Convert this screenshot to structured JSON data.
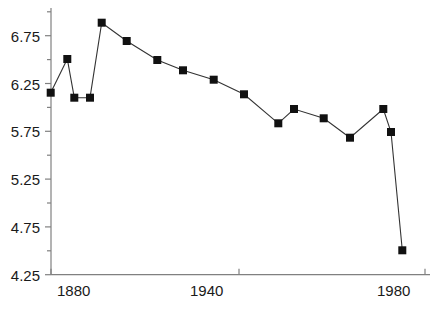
{
  "chart_data": {
    "type": "line",
    "title": "",
    "subtitle": "",
    "xlabel": "",
    "ylabel": "",
    "grid": false,
    "legend": null,
    "marker": "filled-square",
    "line_color": "#333333",
    "marker_color": "#111111",
    "axis_color": "#808080",
    "xlim": [
      1873,
      1986
    ],
    "ylim": [
      4.25,
      7.05
    ],
    "y_ticks_major": [
      4.25,
      4.75,
      5.25,
      5.75,
      6.25,
      6.75
    ],
    "y_ticks_major_labels": [
      "4.25",
      "4.75",
      "5.25",
      "5.75",
      "6.25",
      "6.75"
    ],
    "y_ticks_minor": [
      4.5,
      5.0,
      5.5,
      6.0,
      6.5,
      7.0
    ],
    "x_ticks": [
      1880,
      1940,
      1980
    ],
    "x_tick_labels": [
      "1880",
      "1940",
      "1980"
    ],
    "x": [
      1876,
      1879,
      1882,
      1885,
      1888,
      1895,
      1904,
      1912,
      1921,
      1930,
      1940,
      1946,
      1955,
      1963,
      1973,
      1976,
      1980
    ],
    "y": [
      6.15,
      6.51,
      6.1,
      6.1,
      6.89,
      6.69,
      6.5,
      6.39,
      6.29,
      6.14,
      5.83,
      5.98,
      5.88,
      5.68,
      5.98,
      5.74,
      4.5
    ],
    "points_px": [
      [
        50.7,
        92.7
      ],
      [
        67.3,
        59.0
      ],
      [
        74.3,
        97.7
      ],
      [
        90.0,
        97.7
      ],
      [
        101.7,
        22.7
      ],
      [
        126.7,
        41.0
      ],
      [
        157.3,
        60.0
      ],
      [
        183.0,
        70.3
      ],
      [
        213.7,
        79.7
      ],
      [
        244.0,
        94.3
      ],
      [
        278.3,
        123.3
      ],
      [
        294.0,
        109.0
      ],
      [
        323.7,
        118.3
      ],
      [
        350.0,
        137.7
      ],
      [
        383.3,
        109.0
      ],
      [
        391.0,
        132.0
      ],
      [
        402.3,
        250.3
      ]
    ]
  },
  "axes": {
    "y_labels": [
      "6.75",
      "6.25",
      "5.75",
      "5.25",
      "4.75",
      "4.25"
    ],
    "x_labels": [
      "1880",
      "1940",
      "1980"
    ]
  }
}
